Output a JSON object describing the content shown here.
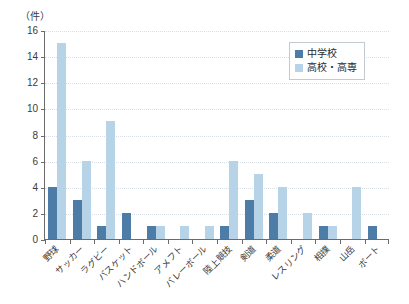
{
  "chart_data": {
    "type": "bar",
    "title": "",
    "subtitle": "",
    "unit_label": "（件）",
    "xlabel": "",
    "ylabel": "",
    "ylim": [
      0,
      16
    ],
    "y_ticks": [
      0,
      2,
      4,
      6,
      8,
      10,
      12,
      14,
      16
    ],
    "grid": true,
    "legend_position": "top-right",
    "categories": [
      "野球",
      "サッカー",
      "ラグビー",
      "バスケット",
      "ハンドボール",
      "アメフト",
      "バレーボール",
      "陸上競技",
      "剣道",
      "柔道",
      "レスリング",
      "相撲",
      "山岳",
      "ボート"
    ],
    "series": [
      {
        "name": "中学校",
        "color": "#4d7da6",
        "values": [
          4,
          3,
          1,
          2,
          1,
          0,
          0,
          1,
          3,
          2,
          0,
          1,
          0,
          1
        ]
      },
      {
        "name": "高校・高専",
        "color": "#b6d3e7",
        "values": [
          15,
          6,
          9,
          0,
          1,
          1,
          1,
          6,
          5,
          4,
          2,
          1,
          4,
          0
        ]
      }
    ]
  },
  "legend": {
    "items": [
      {
        "label": "中学校"
      },
      {
        "label": "高校・高専"
      }
    ]
  }
}
